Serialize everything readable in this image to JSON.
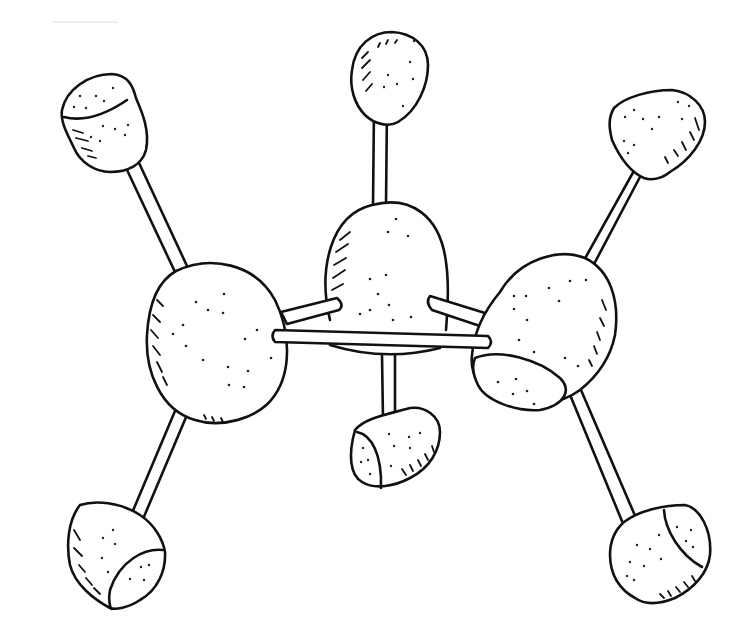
{
  "figure": {
    "style": "black line art on white, stippled shading",
    "colors": {
      "background": "#ffffff",
      "ink": "#111111"
    },
    "atoms": {
      "carbons": [
        {
          "id": "C1",
          "position": "left",
          "cx": 215,
          "cy": 345
        },
        {
          "id": "C2",
          "position": "center",
          "cx": 385,
          "cy": 285
        },
        {
          "id": "C3",
          "position": "right",
          "cx": 555,
          "cy": 325
        }
      ],
      "hydrogens": [
        {
          "id": "H1",
          "attached_to": "C1",
          "position": "upper-left",
          "cx": 102,
          "cy": 118
        },
        {
          "id": "H2",
          "attached_to": "C1",
          "position": "lower-left",
          "cx": 113,
          "cy": 548
        },
        {
          "id": "H3",
          "attached_to": "C2",
          "position": "top",
          "cx": 383,
          "cy": 72
        },
        {
          "id": "H4",
          "attached_to": "C2",
          "position": "bottom",
          "cx": 396,
          "cy": 443
        },
        {
          "id": "H5",
          "attached_to": "C3",
          "position": "upper-right",
          "cx": 658,
          "cy": 135
        },
        {
          "id": "H6",
          "attached_to": "C3",
          "position": "lower-right",
          "cx": 660,
          "cy": 548
        }
      ]
    },
    "bonds": [
      [
        "C1",
        "C2"
      ],
      [
        "C2",
        "C3"
      ],
      [
        "C1",
        "C3"
      ],
      [
        "C1",
        "H1"
      ],
      [
        "C1",
        "H2"
      ],
      [
        "C2",
        "H3"
      ],
      [
        "C2",
        "H4"
      ],
      [
        "C3",
        "H5"
      ],
      [
        "C3",
        "H6"
      ]
    ]
  }
}
